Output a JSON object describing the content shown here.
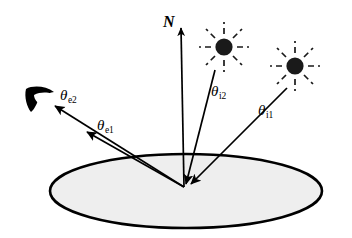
{
  "figure": {
    "kind": "brdf-geometry-diagram",
    "caption_text": "",
    "background_color": "#ffffff",
    "ink_color": "#000000",
    "surface_fill_color": "#eeeeee",
    "surface_stroke_color": "#000000"
  },
  "labels": {
    "normal": {
      "text": "N",
      "semantic": "surface-normal-vector-label",
      "x": 163,
      "y": 14
    },
    "theta_i2": {
      "symbol": "θ",
      "subscript": "i2",
      "semantic": "incident-angle-2-label",
      "x": 211,
      "y": 84
    },
    "theta_i1": {
      "symbol": "θ",
      "subscript": "i1",
      "semantic": "incident-angle-1-label",
      "x": 258,
      "y": 103
    },
    "theta_e2": {
      "symbol": "θ",
      "subscript": "e2",
      "semantic": "exitant-angle-2-label",
      "x": 60,
      "y": 88
    },
    "theta_e1": {
      "symbol": "θ",
      "subscript": "e1",
      "semantic": "exitant-angle-1-label",
      "x": 97,
      "y": 118
    }
  },
  "geometry": {
    "origin": {
      "x": 184,
      "y": 187
    },
    "surface_ellipse": {
      "cx": 186,
      "cy": 191,
      "rx": 136,
      "ry": 37,
      "stroke_width": 2.6
    },
    "normal_arrow": {
      "x1": 184,
      "y1": 187,
      "x2": 181,
      "y2": 26
    },
    "incident_ray_2": {
      "from_x": 215,
      "from_y": 70,
      "to_x": 186,
      "to_y": 186
    },
    "incident_ray_1": {
      "from_x": 287,
      "from_y": 88,
      "to_x": 190,
      "to_y": 186
    },
    "exitant_ray_1": {
      "from_x": 184,
      "from_y": 187,
      "to_x": 85,
      "to_y": 131
    },
    "exitant_ray_2": {
      "from_x": 184,
      "from_y": 187,
      "to_x": 52,
      "to_y": 104
    },
    "light_source_1": {
      "cx": 224,
      "cy": 47,
      "r": 9,
      "ray_count": 8,
      "ray_inner": 13,
      "ray_outer": 25
    },
    "light_source_2": {
      "cx": 295,
      "cy": 66,
      "r": 9,
      "ray_count": 8,
      "ray_inner": 13,
      "ray_outer": 25
    },
    "eye": {
      "cx": 40,
      "cy": 97
    }
  },
  "icon_names": {
    "light_source": "sun-icon",
    "eye": "eye-icon",
    "normal_arrow": "up-arrow-icon",
    "surface": "ellipse-surface-icon"
  }
}
